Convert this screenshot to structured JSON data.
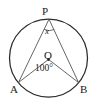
{
  "figure": {
    "type": "circle-geometry-diagram",
    "background_color": "#ffffff",
    "stroke_color": "#2b2b2b",
    "text_color": "#1a1a1a",
    "circle": {
      "center_x": 48.5,
      "center_y": 58,
      "radius": 39,
      "stroke_width": 1.2
    },
    "points": {
      "P": {
        "label": "P",
        "x": 49,
        "y": 19.2
      },
      "A": {
        "label": "A",
        "x": 18.5,
        "y": 82.5
      },
      "B": {
        "label": "B",
        "x": 78.5,
        "y": 82.5
      },
      "O": {
        "label": "O",
        "x": 48.5,
        "y": 58
      }
    },
    "center_dot": {
      "name": "center-point-marker",
      "x": 48.5,
      "y": 59.6,
      "radius": 1.4
    },
    "segments": [
      {
        "name": "segment-PA",
        "from": "P",
        "to": "A"
      },
      {
        "name": "segment-PB",
        "from": "P",
        "to": "B"
      },
      {
        "name": "segment-OA",
        "from": "O",
        "to": "A"
      },
      {
        "name": "segment-OB",
        "from": "O",
        "to": "B"
      }
    ],
    "angles": {
      "inscribed": {
        "name": "angle-APB",
        "vertex": "P",
        "label": "x",
        "arc_radius": 10
      },
      "central": {
        "name": "angle-AOB",
        "vertex": "O",
        "label": "100°",
        "value": 100,
        "unit": "degrees"
      }
    }
  }
}
